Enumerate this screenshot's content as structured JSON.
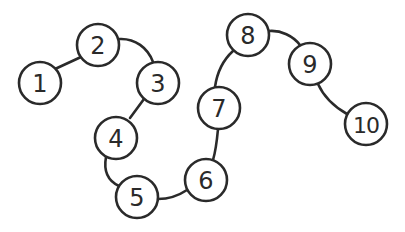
{
  "diagram": {
    "type": "numbered-path",
    "stroke_color": "#2a2a2a",
    "background_color": "#ffffff",
    "nodes": [
      {
        "label": "1",
        "cx": 40,
        "cy": 83,
        "r": 21
      },
      {
        "label": "2",
        "cx": 98,
        "cy": 45,
        "r": 21
      },
      {
        "label": "3",
        "cx": 158,
        "cy": 83,
        "r": 21
      },
      {
        "label": "4",
        "cx": 116,
        "cy": 138,
        "r": 21
      },
      {
        "label": "5",
        "cx": 137,
        "cy": 197,
        "r": 21
      },
      {
        "label": "6",
        "cx": 206,
        "cy": 180,
        "r": 21
      },
      {
        "label": "7",
        "cx": 219,
        "cy": 108,
        "r": 21
      },
      {
        "label": "8",
        "cx": 248,
        "cy": 35,
        "r": 21
      },
      {
        "label": "9",
        "cx": 310,
        "cy": 64,
        "r": 21
      },
      {
        "label": "10",
        "cx": 366,
        "cy": 124,
        "r": 21
      }
    ],
    "edges": [
      {
        "from": "1",
        "to": "2"
      },
      {
        "from": "2",
        "to": "3"
      },
      {
        "from": "3",
        "to": "4"
      },
      {
        "from": "4",
        "to": "5"
      },
      {
        "from": "5",
        "to": "6"
      },
      {
        "from": "6",
        "to": "7"
      },
      {
        "from": "7",
        "to": "8"
      },
      {
        "from": "8",
        "to": "9"
      },
      {
        "from": "9",
        "to": "10"
      }
    ]
  }
}
